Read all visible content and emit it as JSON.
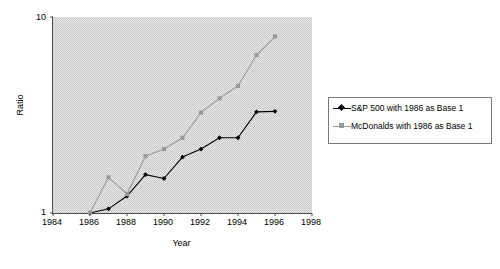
{
  "chart_data": {
    "type": "line",
    "title": "",
    "subtitle": "",
    "xlabel": "Year",
    "ylabel": "Ratio",
    "xlim": [
      1984,
      1998
    ],
    "ylim": [
      1,
      10
    ],
    "yscale": "log",
    "grid": false,
    "plot_background": "#c9c9c9",
    "legend_position": "right",
    "x_ticks": [
      "1984",
      "1986",
      "1988",
      "1990",
      "1992",
      "1994",
      "1996",
      "1998"
    ],
    "x_tick_values": [
      1984,
      1986,
      1988,
      1990,
      1992,
      1994,
      1996,
      1998
    ],
    "y_ticks": [
      "1",
      "10"
    ],
    "y_tick_values": [
      1,
      10
    ],
    "x": [
      1986,
      1987,
      1988,
      1989,
      1990,
      1991,
      1992,
      1993,
      1994,
      1995,
      1996
    ],
    "series": [
      {
        "name": "S&P 500 with 1986 as Base 1",
        "color": "#000000",
        "marker": "diamond",
        "values": [
          1.0,
          1.05,
          1.22,
          1.57,
          1.5,
          1.93,
          2.12,
          2.42,
          2.42,
          3.28,
          3.3
        ]
      },
      {
        "name": "McDonalds with 1986 as Base 1",
        "color": "#9a9a9a",
        "marker": "square",
        "values": [
          1.0,
          1.52,
          1.25,
          1.95,
          2.12,
          2.42,
          3.25,
          3.85,
          4.45,
          6.4,
          7.95
        ]
      }
    ]
  },
  "axes": {
    "x_title": "Year",
    "y_title": "Ratio"
  },
  "legend": {
    "entries": [
      {
        "label": "S&P 500 with 1986 as Base 1",
        "marker": "diamond-marker",
        "color": "#000000"
      },
      {
        "label": "McDonalds with 1986 as Base 1",
        "marker": "square-marker",
        "color": "#9a9a9a"
      }
    ]
  }
}
